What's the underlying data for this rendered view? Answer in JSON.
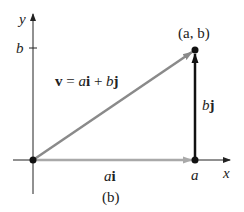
{
  "diagram": {
    "caption": "(b)",
    "axes": {
      "x_label": "x",
      "y_label": "y",
      "x_tick_label": "a",
      "y_tick_label": "b"
    },
    "point_label": "(a, b)",
    "vectors": [
      {
        "id": "v",
        "label": "v = ai + bj",
        "color": "#8a8a8a",
        "from": [
          0,
          0
        ],
        "to": [
          "a",
          "b"
        ]
      },
      {
        "id": "ai",
        "label": "ai",
        "color": "#a9a9a9",
        "from": [
          0,
          0
        ],
        "to": [
          "a",
          0
        ]
      },
      {
        "id": "bj",
        "label": "bj",
        "color": "#111111",
        "from": [
          "a",
          0
        ],
        "to": [
          "a",
          "b"
        ]
      }
    ],
    "colors": {
      "axis": "#222222",
      "v_vector": "#8a8a8a",
      "ai_vector": "#a9a9a9",
      "bj_vector": "#111111",
      "point": "#111111"
    }
  }
}
